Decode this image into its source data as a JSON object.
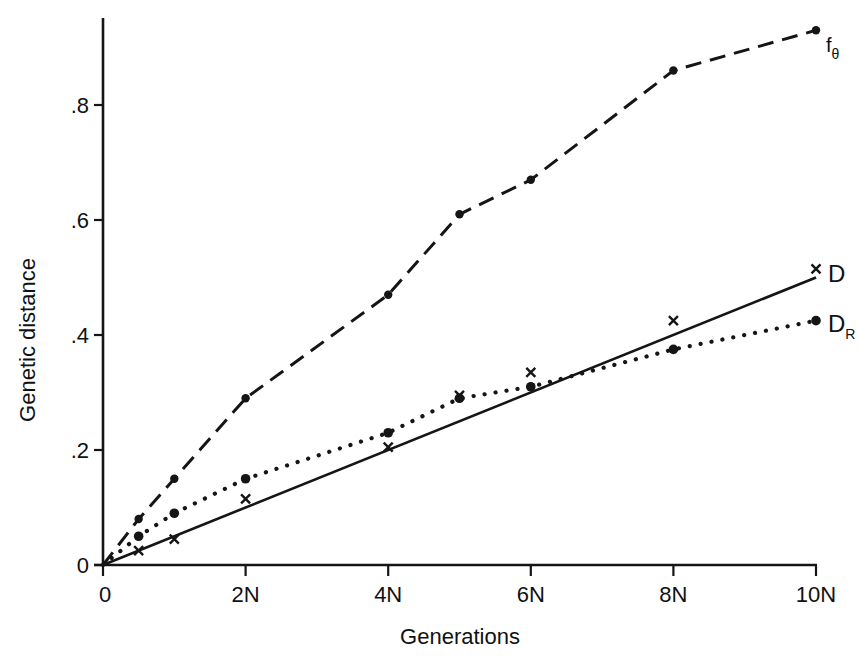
{
  "chart_data": {
    "type": "line",
    "title": "",
    "xlabel": "Generations",
    "ylabel": "Genetic distance",
    "x_unit": "N",
    "x_tick_labels": [
      "0",
      "2N",
      "4N",
      "6N",
      "8N",
      "10N"
    ],
    "x_tick_values": [
      0,
      2,
      4,
      6,
      8,
      10
    ],
    "y_tick_labels": [
      "0",
      ".2",
      ".4",
      ".6",
      ".8"
    ],
    "y_tick_values": [
      0,
      0.2,
      0.4,
      0.6,
      0.8
    ],
    "xlim": [
      0,
      10
    ],
    "ylim": [
      0,
      1.0
    ],
    "grid": false,
    "legend": "inline labels at right end of each series",
    "series": [
      {
        "name": "f_θ",
        "label_main": "f",
        "label_sub": "θ",
        "line_style": "dashed",
        "marker": "dot",
        "x": [
          0,
          0.5,
          1,
          2,
          4,
          5,
          6,
          8,
          10
        ],
        "values": [
          0,
          0.08,
          0.15,
          0.29,
          0.47,
          0.61,
          0.67,
          0.86,
          0.93
        ]
      },
      {
        "name": "D",
        "label_main": "D",
        "label_sub": "",
        "line_style": "solid",
        "marker": "cross",
        "line_fit": {
          "x": [
            0,
            10
          ],
          "values": [
            0,
            0.5
          ]
        },
        "x": [
          0.5,
          1,
          2,
          4,
          5,
          6,
          8,
          10
        ],
        "values": [
          0.025,
          0.045,
          0.115,
          0.205,
          0.295,
          0.335,
          0.425,
          0.515
        ]
      },
      {
        "name": "D_R",
        "label_main": "D",
        "label_sub": "R",
        "line_style": "dotted",
        "marker": "dot",
        "x": [
          0,
          0.5,
          1,
          2,
          4,
          5,
          6,
          8,
          10
        ],
        "values": [
          0,
          0.05,
          0.09,
          0.15,
          0.23,
          0.29,
          0.31,
          0.375,
          0.425
        ]
      }
    ]
  }
}
